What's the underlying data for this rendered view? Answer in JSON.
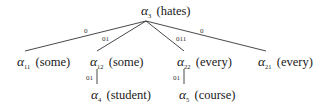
{
  "diagram": {
    "type": "derivation-tree",
    "nodes": [
      {
        "id": "root",
        "symbol": "α",
        "subscript": "3",
        "word": "(hates)"
      },
      {
        "id": "n11",
        "symbol": "α",
        "subscript": "11",
        "word": "(some)"
      },
      {
        "id": "n12",
        "symbol": "α",
        "subscript": "12",
        "word": "(some)"
      },
      {
        "id": "n22",
        "symbol": "α",
        "subscript": "22",
        "word": "(every)"
      },
      {
        "id": "n21",
        "symbol": "α",
        "subscript": "21",
        "word": "(every)"
      },
      {
        "id": "n4",
        "symbol": "α",
        "subscript": "4",
        "word": "(student)"
      },
      {
        "id": "n5",
        "symbol": "α",
        "subscript": "5",
        "word": "(course)"
      }
    ],
    "edges": [
      {
        "from": "root",
        "to": "n11",
        "label": "0"
      },
      {
        "from": "root",
        "to": "n12",
        "label": "01"
      },
      {
        "from": "root",
        "to": "n22",
        "label": "011"
      },
      {
        "from": "root",
        "to": "n21",
        "label": "0"
      },
      {
        "from": "n12",
        "to": "n4",
        "label": "01"
      },
      {
        "from": "n22",
        "to": "n5",
        "label": "01"
      }
    ],
    "colors": {
      "line": "#333333",
      "text": "#1a1a1a",
      "background": "#ffffff"
    }
  }
}
